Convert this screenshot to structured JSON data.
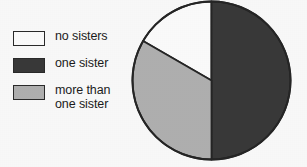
{
  "chart_data": {
    "type": "pie",
    "title": "",
    "subtitle": "",
    "xlabel": "",
    "ylabel": "",
    "legend_position": "left",
    "grid": false,
    "categories": [
      "no sisters",
      "one sister",
      "more than one sister"
    ],
    "values": [
      16.7,
      50.0,
      33.3
    ],
    "slices": [
      {
        "label": "no sisters",
        "legend_label": "no sisters",
        "percent": 16.7,
        "start_angle_deg": 90,
        "end_angle_deg": 150,
        "sweep_deg": 60,
        "color": "#ffffff"
      },
      {
        "label": "one sister",
        "legend_label": "one sister",
        "percent": 50.0,
        "start_angle_deg": -90,
        "end_angle_deg": 90,
        "sweep_deg": 180,
        "color": "#3a3a3a"
      },
      {
        "label": "more than one sister",
        "legend_label": "more than\none sister",
        "percent": 33.3,
        "start_angle_deg": 150,
        "end_angle_deg": 270,
        "sweep_deg": 120,
        "color": "#b2b2b2"
      }
    ],
    "annotations": []
  },
  "legend": {
    "items": [
      {
        "label": "no sisters",
        "swatch_class": "swatch-white",
        "color": "#ffffff"
      },
      {
        "label": "one sister",
        "swatch_class": "swatch-dark",
        "color": "#3a3a3a"
      },
      {
        "label": "more than\none sister",
        "swatch_class": "swatch-light",
        "color": "#b2b2b2"
      }
    ]
  },
  "pie": {
    "center_x": 80.5,
    "center_y": 80.5,
    "radius": 79,
    "outline_color": "#262626"
  }
}
